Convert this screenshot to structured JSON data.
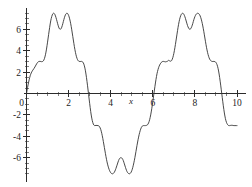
{
  "chart_data": {
    "type": "line",
    "title": "",
    "subtitle": "",
    "xlabel": "x",
    "ylabel": "",
    "xlim": [
      0,
      10
    ],
    "ylim": [
      -8.2,
      8.2
    ],
    "grid": false,
    "legend": null,
    "axis_style": "centered-spines",
    "x_ticks": [
      0,
      2,
      4,
      6,
      8,
      10
    ],
    "x_tick_labels": [
      "0",
      "2",
      "4",
      "6",
      "8",
      "10"
    ],
    "y_ticks": [
      -6,
      -4,
      -2,
      0,
      2,
      4,
      6
    ],
    "y_tick_labels": [
      "-6",
      "-4",
      "-2",
      "0",
      "2",
      "4",
      "6"
    ],
    "x_minor_step": 0.5,
    "y_minor_step": 0.5,
    "series": [
      {
        "name": "f(x)",
        "color": "#333333",
        "description": "Periodic harmonic superposition with twin-peaked crests and mirrored twin troughs, period 2*pi",
        "annotations": {
          "period": 6.283,
          "first_crest_peaks_x": [
            1.15,
            1.95
          ],
          "first_crest_peak_value": 7.5,
          "crest_center_dip_x": 1.55,
          "crest_center_dip_value": 6.0,
          "shoulder_value": 3.0,
          "zero_crossing_descending_1_x": 3.0,
          "trough_dips_x": [
            4.35,
            5.15
          ],
          "trough_dip_value": -7.5,
          "trough_center_bump_x": 4.75,
          "trough_center_bump_value": -6.0,
          "zero_crossing_ascending_x": 6.25,
          "second_crest_peaks_x": [
            7.45,
            8.25
          ],
          "zero_crossing_descending_2_x": 9.4,
          "value_at_x_10": -3.0
        },
        "points": [
          [
            0.0,
            0.0
          ],
          [
            0.05,
            0.55
          ],
          [
            0.1,
            1.05
          ],
          [
            0.15,
            1.48
          ],
          [
            0.2,
            1.8
          ],
          [
            0.25,
            2.02
          ],
          [
            0.3,
            2.18
          ],
          [
            0.35,
            2.32
          ],
          [
            0.4,
            2.48
          ],
          [
            0.45,
            2.66
          ],
          [
            0.5,
            2.83
          ],
          [
            0.55,
            2.95
          ],
          [
            0.6,
            3.0
          ],
          [
            0.65,
            3.0
          ],
          [
            0.7,
            2.98
          ],
          [
            0.75,
            2.98
          ],
          [
            0.8,
            3.05
          ],
          [
            0.85,
            3.25
          ],
          [
            0.9,
            3.62
          ],
          [
            0.95,
            4.15
          ],
          [
            1.0,
            4.8
          ],
          [
            1.05,
            5.5
          ],
          [
            1.1,
            6.18
          ],
          [
            1.15,
            6.78
          ],
          [
            1.2,
            7.2
          ],
          [
            1.25,
            7.45
          ],
          [
            1.3,
            7.5
          ],
          [
            1.35,
            7.38
          ],
          [
            1.4,
            7.1
          ],
          [
            1.45,
            6.75
          ],
          [
            1.5,
            6.38
          ],
          [
            1.55,
            6.1
          ],
          [
            1.6,
            6.0
          ],
          [
            1.65,
            6.08
          ],
          [
            1.7,
            6.35
          ],
          [
            1.75,
            6.72
          ],
          [
            1.8,
            7.08
          ],
          [
            1.85,
            7.36
          ],
          [
            1.9,
            7.49
          ],
          [
            1.95,
            7.48
          ],
          [
            2.0,
            7.3
          ],
          [
            2.05,
            6.98
          ],
          [
            2.1,
            6.52
          ],
          [
            2.15,
            5.95
          ],
          [
            2.2,
            5.32
          ],
          [
            2.25,
            4.68
          ],
          [
            2.3,
            4.1
          ],
          [
            2.35,
            3.62
          ],
          [
            2.4,
            3.28
          ],
          [
            2.45,
            3.08
          ],
          [
            2.5,
            3.0
          ],
          [
            2.55,
            2.99
          ],
          [
            2.6,
            3.0
          ],
          [
            2.65,
            2.98
          ],
          [
            2.7,
            2.86
          ],
          [
            2.75,
            2.58
          ],
          [
            2.8,
            2.12
          ],
          [
            2.85,
            1.48
          ],
          [
            2.9,
            0.72
          ],
          [
            2.95,
            -0.1
          ],
          [
            3.0,
            -0.92
          ],
          [
            3.05,
            -1.68
          ],
          [
            3.1,
            -2.3
          ],
          [
            3.15,
            -2.72
          ],
          [
            3.2,
            -2.95
          ],
          [
            3.25,
            -3.0
          ],
          [
            3.3,
            -2.98
          ],
          [
            3.35,
            -2.99
          ],
          [
            3.4,
            -3.0
          ],
          [
            3.45,
            -3.05
          ],
          [
            3.5,
            -3.22
          ],
          [
            3.55,
            -3.52
          ],
          [
            3.6,
            -3.95
          ],
          [
            3.65,
            -4.48
          ],
          [
            3.7,
            -5.05
          ],
          [
            3.75,
            -5.62
          ],
          [
            3.8,
            -6.15
          ],
          [
            3.85,
            -6.6
          ],
          [
            3.9,
            -6.95
          ],
          [
            3.95,
            -7.22
          ],
          [
            4.0,
            -7.4
          ],
          [
            4.05,
            -7.49
          ],
          [
            4.1,
            -7.5
          ],
          [
            4.15,
            -7.42
          ],
          [
            4.2,
            -7.25
          ],
          [
            4.25,
            -7.0
          ],
          [
            4.3,
            -6.7
          ],
          [
            4.35,
            -6.4
          ],
          [
            4.4,
            -6.15
          ],
          [
            4.45,
            -6.02
          ],
          [
            4.5,
            -6.0
          ],
          [
            4.55,
            -6.08
          ],
          [
            4.6,
            -6.28
          ],
          [
            4.65,
            -6.58
          ],
          [
            4.7,
            -6.9
          ],
          [
            4.75,
            -7.18
          ],
          [
            4.8,
            -7.38
          ],
          [
            4.85,
            -7.48
          ],
          [
            4.9,
            -7.5
          ],
          [
            4.95,
            -7.42
          ],
          [
            5.0,
            -7.22
          ],
          [
            5.05,
            -6.9
          ],
          [
            5.1,
            -6.48
          ],
          [
            5.15,
            -5.98
          ],
          [
            5.2,
            -5.42
          ],
          [
            5.25,
            -4.85
          ],
          [
            5.3,
            -4.32
          ],
          [
            5.35,
            -3.85
          ],
          [
            5.4,
            -3.48
          ],
          [
            5.45,
            -3.2
          ],
          [
            5.5,
            -3.05
          ],
          [
            5.55,
            -3.0
          ],
          [
            5.6,
            -3.0
          ],
          [
            5.65,
            -3.0
          ],
          [
            5.7,
            -2.98
          ],
          [
            5.75,
            -2.92
          ],
          [
            5.8,
            -2.75
          ],
          [
            5.85,
            -2.45
          ],
          [
            5.9,
            -2.0
          ],
          [
            5.95,
            -1.42
          ],
          [
            6.0,
            -0.75
          ],
          [
            6.05,
            -0.05
          ],
          [
            6.1,
            0.65
          ],
          [
            6.15,
            1.3
          ],
          [
            6.2,
            1.85
          ],
          [
            6.25,
            2.25
          ],
          [
            6.3,
            2.55
          ],
          [
            6.35,
            2.75
          ],
          [
            6.4,
            2.9
          ],
          [
            6.45,
            2.98
          ],
          [
            6.5,
            3.0
          ],
          [
            6.55,
            2.98
          ],
          [
            6.6,
            2.96
          ],
          [
            6.65,
            2.98
          ],
          [
            6.7,
            3.02
          ],
          [
            6.75,
            3.1
          ],
          [
            6.8,
            3.05
          ],
          [
            6.85,
            3.02
          ],
          [
            6.9,
            3.1
          ],
          [
            6.95,
            3.35
          ],
          [
            7.0,
            3.75
          ],
          [
            7.05,
            4.28
          ],
          [
            7.1,
            4.9
          ],
          [
            7.15,
            5.55
          ],
          [
            7.2,
            6.18
          ],
          [
            7.25,
            6.72
          ],
          [
            7.3,
            7.12
          ],
          [
            7.35,
            7.38
          ],
          [
            7.4,
            7.49
          ],
          [
            7.45,
            7.47
          ],
          [
            7.5,
            7.3
          ],
          [
            7.55,
            7.02
          ],
          [
            7.6,
            6.68
          ],
          [
            7.65,
            6.35
          ],
          [
            7.7,
            6.12
          ],
          [
            7.75,
            6.0
          ],
          [
            7.8,
            6.05
          ],
          [
            7.85,
            6.25
          ],
          [
            7.9,
            6.55
          ],
          [
            7.95,
            6.9
          ],
          [
            8.0,
            7.18
          ],
          [
            8.05,
            7.38
          ],
          [
            8.1,
            7.48
          ],
          [
            8.15,
            7.5
          ],
          [
            8.2,
            7.42
          ],
          [
            8.25,
            7.25
          ],
          [
            8.3,
            6.95
          ],
          [
            8.35,
            6.55
          ],
          [
            8.4,
            6.05
          ],
          [
            8.45,
            5.48
          ],
          [
            8.5,
            4.88
          ],
          [
            8.55,
            4.32
          ],
          [
            8.6,
            3.85
          ],
          [
            8.65,
            3.48
          ],
          [
            8.7,
            3.22
          ],
          [
            8.75,
            3.08
          ],
          [
            8.8,
            3.0
          ],
          [
            8.85,
            2.99
          ],
          [
            8.9,
            3.0
          ],
          [
            8.95,
            2.98
          ],
          [
            9.0,
            2.9
          ],
          [
            9.05,
            2.7
          ],
          [
            9.1,
            2.35
          ],
          [
            9.15,
            1.82
          ],
          [
            9.2,
            1.15
          ],
          [
            9.25,
            0.4
          ],
          [
            9.3,
            -0.38
          ],
          [
            9.35,
            -1.15
          ],
          [
            9.4,
            -1.82
          ],
          [
            9.45,
            -2.35
          ],
          [
            9.5,
            -2.7
          ],
          [
            9.55,
            -2.9
          ],
          [
            9.6,
            -2.99
          ],
          [
            9.65,
            -3.0
          ],
          [
            9.7,
            -2.98
          ],
          [
            9.75,
            -2.97
          ],
          [
            9.8,
            -2.98
          ],
          [
            9.85,
            -3.0
          ],
          [
            9.9,
            -3.0
          ],
          [
            9.95,
            -3.0
          ],
          [
            10.0,
            -3.0
          ]
        ]
      }
    ]
  },
  "figure": {
    "background_color": "#ffffff",
    "curve_color": "#333333",
    "axis_color": "#2b2b2b",
    "text_color": "#1d1d1d"
  }
}
